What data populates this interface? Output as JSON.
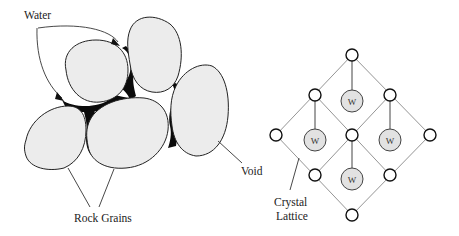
{
  "left_diagram": {
    "title": "Porous rock",
    "labels": {
      "water": "Water",
      "void": "Void",
      "rock_grains": "Rock Grains"
    },
    "grain_count": 5
  },
  "right_diagram": {
    "title": "Crystal lattice",
    "labels": {
      "crystal": "Crystal",
      "lattice": "Lattice"
    },
    "water_molecule_label": "W",
    "lattice_node_count": 9,
    "water_molecule_count": 4
  },
  "colors": {
    "grain_fill": "#ececec",
    "water_fill": "#0b0b0b",
    "w_circle_fill": "#e2e2e2",
    "line": "#222222"
  }
}
